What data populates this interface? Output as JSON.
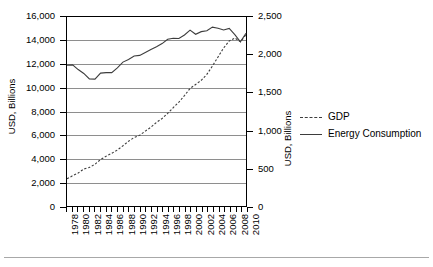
{
  "chart_data": {
    "type": "line",
    "title": "",
    "xlabel": "",
    "ylabel": "USD, Billions",
    "y2label": "USD, Billions",
    "grid": true,
    "legend_position": "right-outside",
    "xlim": [
      1978,
      2010
    ],
    "ylim": [
      0,
      16000
    ],
    "y2lim": [
      0,
      2500
    ],
    "yticks": [
      0,
      2000,
      4000,
      6000,
      8000,
      10000,
      12000,
      14000,
      16000
    ],
    "ytick_labels": [
      "0",
      "2,000",
      "4,000",
      "6,000",
      "8,000",
      "10,000",
      "12,000",
      "14,000",
      "16,000"
    ],
    "y2ticks": [
      0,
      500,
      1000,
      1500,
      2000,
      2500
    ],
    "y2tick_labels": [
      "0",
      "500",
      "1,000",
      "1,500",
      "2,000",
      "2,500"
    ],
    "x": [
      1978,
      1979,
      1980,
      1981,
      1982,
      1983,
      1984,
      1985,
      1986,
      1987,
      1988,
      1989,
      1990,
      1991,
      1992,
      1993,
      1994,
      1995,
      1996,
      1997,
      1998,
      1999,
      2000,
      2001,
      2002,
      2003,
      2004,
      2005,
      2006,
      2007,
      2008,
      2009,
      2010
    ],
    "xtick_labels": [
      "1978",
      "1980",
      "1982",
      "1984",
      "1986",
      "1988",
      "1990",
      "1992",
      "1994",
      "1996",
      "1998",
      "2000",
      "2002",
      "2004",
      "2006",
      "2008",
      "2010"
    ],
    "series": [
      {
        "name": "GDP",
        "style": "dashed",
        "axis": "left",
        "color": "#3d3d3d",
        "values": [
          2300,
          2560,
          2790,
          3130,
          3260,
          3530,
          3930,
          4220,
          4460,
          4740,
          5100,
          5480,
          5800,
          5990,
          6340,
          6670,
          7080,
          7410,
          7840,
          8330,
          8790,
          9350,
          9950,
          10290,
          10640,
          11140,
          11850,
          12620,
          13380,
          13970,
          14220,
          13900,
          14500
        ]
      },
      {
        "name": "Energy Consumption",
        "style": "solid",
        "axis": "left",
        "color": "#3d3d3d",
        "values": [
          11930,
          11950,
          11550,
          11220,
          10760,
          10740,
          11250,
          11290,
          11290,
          11700,
          12180,
          12400,
          12700,
          12750,
          13000,
          13250,
          13480,
          13750,
          14120,
          14200,
          14180,
          14480,
          14890,
          14540,
          14760,
          14830,
          15140,
          15050,
          14900,
          15030,
          14500,
          13900,
          14620
        ]
      }
    ]
  },
  "axes": {
    "left_title": "USD, Billions",
    "right_title": "USD, Billions"
  },
  "legend": {
    "items": [
      {
        "label": "GDP",
        "key": "dashed-line-key"
      },
      {
        "label": "Energy Consumption",
        "key": "solid-line-key"
      }
    ]
  }
}
